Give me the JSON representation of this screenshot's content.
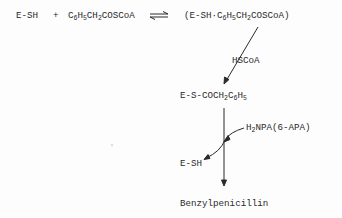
{
  "diagram": {
    "equation": {
      "reactant1": "E-SH",
      "plus": "+",
      "reactant2_parts": [
        "C",
        "6",
        "H",
        "5",
        "CH",
        "2",
        "COSCoA"
      ],
      "arrow": "equilibrium",
      "complex_parts": [
        "(E-SH·C",
        "6",
        "H",
        "5",
        "CH",
        "2",
        "COSCoA)"
      ]
    },
    "release_label": "HSCoA",
    "intermediate_parts": [
      "E-S-COCH",
      "2",
      "C",
      "6",
      "H",
      "5"
    ],
    "nucleophile_parts": [
      "H",
      "2",
      "NPA(6-APA)"
    ],
    "regenerated_enzyme": "E-SH",
    "product": "Benzylpenicillin",
    "colors": {
      "ink": "#2a2a2a",
      "background": "#fdfdfd"
    }
  }
}
